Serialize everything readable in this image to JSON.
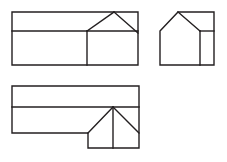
{
  "document": {
    "title": "Architectural Line Drawing",
    "background_color": "#ffffff",
    "stroke_color": "#231f20",
    "stroke_width": 1.4,
    "canvas": {
      "width": 227,
      "height": 162
    }
  },
  "figures": [
    {
      "id": "figure-top-left",
      "name": "Long elevation with right-end gable",
      "description": "Wide rectangle divided by a horizontal line near the top; a gabled roof peak rises from the right-hand portion and touches the top edge; a vertical line separates the gabled bay from the long body.",
      "outline": "M 12 12 L 138 12 L 138 65 L 12 65 Z",
      "interior_lines": [
        "M 12 31 L 138 31",
        "M 87 31 L 87 65",
        "M 87 31 L 114 12",
        "M 114 12 L 138 33"
      ]
    },
    {
      "id": "figure-top-right",
      "name": "Gable end with side bay",
      "description": "House-shaped gable silhouette on the left joined to a rectangular bay on the right; a horizontal ledge and a vertical divider define the bay.",
      "outline": "M 160 31 L 178 12 L 214 12 L 214 65 L 160 65 Z",
      "interior_lines": [
        "M 178 12 L 200 31",
        "M 200 31 L 214 31",
        "M 200 31 L 200 65"
      ]
    },
    {
      "id": "figure-bottom",
      "name": "Stepped plan with central gable",
      "description": "Wide rectangle with a horizontal band across the top; below, the body steps down at the right into a lower rectangle containing a central gable peak with a ridge line dropping to the base.",
      "outline": "M 12 86 L 139 86 L 139 148 L 88 148 L 88 133 L 12 133 Z",
      "interior_lines": [
        "M 12 107 L 139 107",
        "M 88 133 L 113 107",
        "M 113 107 L 139 133",
        "M 113 107 L 113 148"
      ]
    }
  ]
}
